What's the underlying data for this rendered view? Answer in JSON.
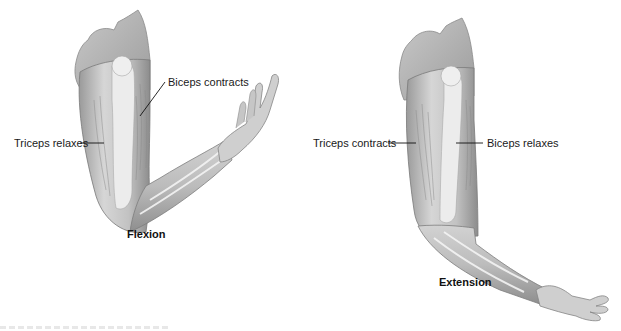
{
  "diagram": {
    "panels": [
      {
        "id": "flexion",
        "caption": "Flexion",
        "labels": {
          "biceps": "Biceps contracts",
          "triceps": "Triceps relaxes"
        }
      },
      {
        "id": "extension",
        "caption": "Extension",
        "labels": {
          "triceps": "Triceps contracts",
          "biceps": "Biceps  relaxes"
        }
      }
    ],
    "colors": {
      "skin_light": "#e4e4e4",
      "skin_mid": "#c4c4c4",
      "skin_dark": "#8f8f8f",
      "bone": "#f2f2f2",
      "leader_line": "#111111",
      "label_text": "#1a1a1a"
    }
  }
}
